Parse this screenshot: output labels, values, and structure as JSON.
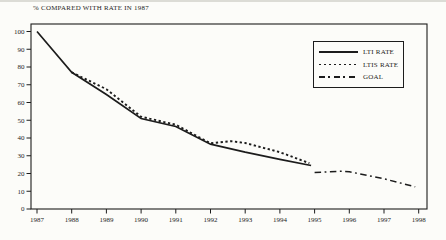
{
  "page": {
    "background": "#fcfcf9",
    "ink": "#1c1c1c"
  },
  "chart_data": {
    "type": "line",
    "title": "% COMPARED WITH RATE IN 1987",
    "xlabel": "",
    "ylabel": "% compared with rate in 1987",
    "xlim": [
      1987,
      1998
    ],
    "ylim": [
      0,
      100
    ],
    "x_ticks": [
      1987,
      1988,
      1989,
      1990,
      1991,
      1992,
      1993,
      1994,
      1995,
      1996,
      1997,
      1998
    ],
    "y_ticks": [
      0,
      10,
      20,
      30,
      40,
      50,
      60,
      70,
      80,
      90,
      100
    ],
    "grid": false,
    "legend_position": "upper right",
    "legend_boxed": true,
    "series": [
      {
        "name": "LTI RATE",
        "style": "solid",
        "color": "#1c1c1c",
        "points": [
          [
            1987,
            100
          ],
          [
            1988,
            77
          ],
          [
            1989,
            64.5
          ],
          [
            1990,
            51
          ],
          [
            1991,
            46.5
          ],
          [
            1992,
            36.5
          ],
          [
            1993,
            32
          ],
          [
            1994,
            28
          ],
          [
            1994.9,
            24.5
          ]
        ]
      },
      {
        "name": "LTIS RATE",
        "style": "dotted",
        "color": "#1c1c1c",
        "points": [
          [
            1988,
            77
          ],
          [
            1989,
            67.5
          ],
          [
            1990,
            52
          ],
          [
            1991,
            47.5
          ],
          [
            1992,
            37
          ],
          [
            1992.6,
            38.2
          ],
          [
            1993,
            37.2
          ],
          [
            1994,
            32
          ],
          [
            1994.85,
            25.8
          ]
        ]
      },
      {
        "name": "GOAL",
        "style": "dashdot",
        "color": "#1c1c1c",
        "points": [
          [
            1995,
            20.5
          ],
          [
            1995.8,
            21.3
          ],
          [
            1996,
            21
          ],
          [
            1997,
            17
          ],
          [
            1997.9,
            12.5
          ]
        ]
      }
    ]
  }
}
